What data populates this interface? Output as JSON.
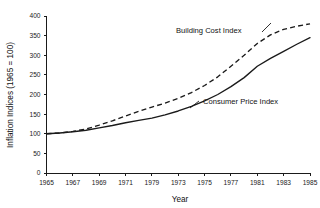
{
  "chart_data": {
    "type": "line",
    "title": "",
    "xlabel": "Year",
    "ylabel": "Inflation Indices (1965 = 100)",
    "xlim": [
      1965,
      1985
    ],
    "ylim": [
      0,
      400
    ],
    "grid": false,
    "legend_position": "inline-annotations",
    "x_tick_labels": [
      "1965",
      "1967",
      "1969",
      "1971",
      "1979",
      "1973",
      "1975",
      "1977",
      "1981",
      "1983",
      "1985"
    ],
    "y_tick_labels": [
      "0",
      "50",
      "100",
      "150",
      "200",
      "250",
      "300",
      "350",
      "400"
    ],
    "y_ticks": [
      0,
      50,
      100,
      150,
      200,
      250,
      300,
      350,
      400
    ],
    "x": [
      1965,
      1966,
      1967,
      1968,
      1969,
      1970,
      1971,
      1972,
      1973,
      1974,
      1975,
      1976,
      1977,
      1978,
      1979,
      1980,
      1981,
      1982,
      1983,
      1984,
      1985
    ],
    "series": [
      {
        "name": "Building Cost Index",
        "style": "dashed",
        "values": [
          100,
          102,
          106,
          112,
          122,
          133,
          145,
          157,
          168,
          178,
          190,
          205,
          223,
          245,
          272,
          300,
          330,
          352,
          366,
          374,
          380
        ]
      },
      {
        "name": "Consumer Price Index",
        "style": "solid",
        "values": [
          100,
          102,
          105,
          109,
          115,
          121,
          128,
          134,
          140,
          148,
          158,
          170,
          184,
          200,
          220,
          243,
          272,
          292,
          310,
          328,
          345
        ]
      }
    ],
    "annotations": [
      {
        "text": "Building Cost Index",
        "series": "Building Cost Index"
      },
      {
        "text": "Consumer Price Index",
        "series": "Consumer Price Index"
      }
    ]
  }
}
